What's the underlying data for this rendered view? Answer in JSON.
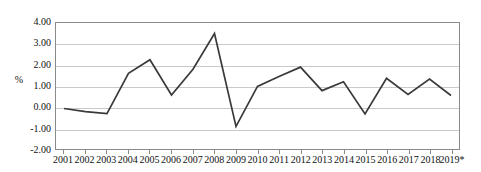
{
  "chart_data": {
    "type": "line",
    "title": "",
    "subtitle": "",
    "xlabel": "",
    "ylabel": "%",
    "ylim": [
      -2.0,
      4.0
    ],
    "ytick_step": 1.0,
    "yticks": [
      "4.00",
      "3.00",
      "2.00",
      "1.00",
      "0.00",
      "-1.00",
      "-2.00"
    ],
    "ytick_values": [
      4.0,
      3.0,
      2.0,
      1.0,
      0.0,
      -1.0,
      -2.0
    ],
    "grid": true,
    "grid_axis": "y",
    "legend": false,
    "legend_position": "none",
    "categories": [
      "2001",
      "2002",
      "2003",
      "2004",
      "2005",
      "2006",
      "2007",
      "2008",
      "2009",
      "2010",
      "2011",
      "2012",
      "2013",
      "2014",
      "2015",
      "2016",
      "2017",
      "2018",
      "2019*"
    ],
    "values": [
      -0.07,
      -0.22,
      -0.32,
      1.6,
      2.25,
      0.57,
      1.8,
      3.5,
      -0.92,
      0.98,
      1.45,
      1.9,
      0.78,
      1.2,
      -0.33,
      1.37,
      0.6,
      1.33,
      0.55
    ],
    "series": [
      {
        "name": "annual change",
        "color": "#3a3a3a",
        "values": [
          -0.07,
          -0.22,
          -0.32,
          1.6,
          2.25,
          0.57,
          1.8,
          3.5,
          -0.92,
          0.98,
          1.45,
          1.9,
          0.78,
          1.2,
          -0.33,
          1.37,
          0.6,
          1.33,
          0.55
        ]
      }
    ],
    "annotations": [],
    "footnote": ""
  },
  "style": {
    "line_color": "#3a3a3a",
    "grid_color": "#c9c9c9",
    "axis_color": "#8a8a8a",
    "text_color": "#111111",
    "background": "#ffffff"
  }
}
